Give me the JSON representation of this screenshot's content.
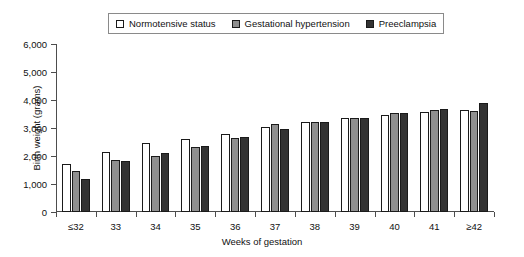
{
  "chart_data": {
    "type": "bar",
    "title": "",
    "xlabel": "Weeks of gestation",
    "ylabel": "Birth weight (grams)",
    "categories": [
      "≤32",
      "33",
      "34",
      "35",
      "36",
      "37",
      "38",
      "39",
      "40",
      "41",
      "≥42"
    ],
    "ylim": [
      0,
      6000
    ],
    "ytick_values": [
      0,
      1000,
      2000,
      3000,
      4000,
      5000,
      6000
    ],
    "ytick_labels": [
      "0",
      "1,000",
      "2,000",
      "3,000",
      "4,000",
      "5,000",
      "6,000"
    ],
    "grid": false,
    "legend_position": "top-center",
    "series": [
      {
        "name": "Normotensive status",
        "color": "#ffffff",
        "values": [
          1700,
          2150,
          2450,
          2600,
          2800,
          3020,
          3200,
          3340,
          3470,
          3580,
          3650
        ]
      },
      {
        "name": "Gestational hypertension",
        "color": "#8f8f8f",
        "values": [
          1450,
          1840,
          2010,
          2310,
          2640,
          3130,
          3220,
          3360,
          3520,
          3640,
          3590
        ]
      },
      {
        "name": "Preeclampsia",
        "color": "#333333",
        "values": [
          1190,
          1810,
          2100,
          2370,
          2680,
          2980,
          3220,
          3360,
          3520,
          3670,
          3900
        ]
      }
    ]
  },
  "legend": {
    "items": [
      {
        "label": "Normotensive status",
        "swatch": "#ffffff"
      },
      {
        "label": "Gestational hypertension",
        "swatch": "#8f8f8f"
      },
      {
        "label": "Preeclampsia",
        "swatch": "#333333"
      }
    ]
  }
}
